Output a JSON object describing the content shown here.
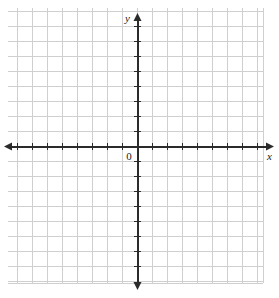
{
  "figure": {
    "width": 279,
    "height": 298,
    "background_color": "#ffffff"
  },
  "labels": {
    "x_axis": "x",
    "y_axis": "y",
    "origin": "0"
  },
  "chart_data": {
    "type": "scatter",
    "title": "",
    "xlabel": "x",
    "ylabel": "y",
    "origin_label": "0",
    "series": [
      {
        "name": "empty",
        "x": [],
        "y": []
      }
    ],
    "xlim": [
      -8.6,
      8.4
    ],
    "ylim": [
      -9.1,
      9.2
    ],
    "x_tick_values": [
      -8,
      -7,
      -6,
      -5,
      -4,
      -3,
      -2,
      -1,
      1,
      2,
      3,
      4,
      5,
      6,
      7,
      8
    ],
    "y_tick_values": [
      -9,
      -8,
      -7,
      -6,
      -5,
      -4,
      -3,
      -2,
      -1,
      1,
      2,
      3,
      4,
      5,
      6,
      7,
      8,
      9
    ],
    "x_tick_labels": [],
    "y_tick_labels": [],
    "tick_spacing": 1,
    "grid": true,
    "grid_spacing": 1,
    "legend": false,
    "legend_position": "none",
    "annotations": [],
    "axis_arrows": [
      "left",
      "right",
      "up",
      "down"
    ]
  },
  "geometry": {
    "grid_left": 8,
    "grid_top": 8,
    "grid_right": 263,
    "grid_bottom": 283,
    "cell_size": 15,
    "origin_x": 137,
    "origin_y": 146,
    "x_axis_start": 4,
    "x_axis_end": 274,
    "y_axis_start": 13,
    "y_axis_end": 290,
    "tick_half_length": 3
  },
  "colors": {
    "grid_line": "#cfcfcf",
    "axis_line": "#2b2b2b",
    "label_text": "#1a1a1a",
    "background": "#ffffff"
  }
}
